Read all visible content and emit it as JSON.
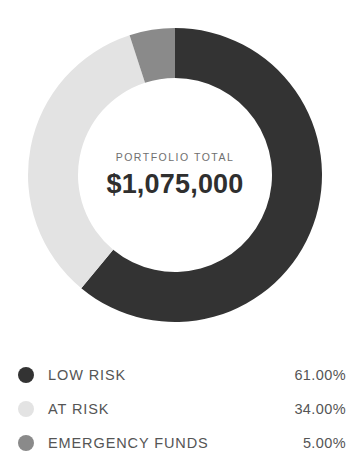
{
  "chart_data": {
    "type": "pie",
    "variant": "donut",
    "title": "",
    "center_caption": "PORTFOLIO TOTAL",
    "center_value": "$1,075,000",
    "total_value": 1075000,
    "currency": "$",
    "start_angle_deg": 0,
    "direction": "clockwise",
    "categories": [
      "LOW RISK",
      "AT RISK",
      "EMERGENCY FUNDS"
    ],
    "values": [
      61.0,
      34.0,
      5.0
    ],
    "value_labels": [
      "61.00%",
      "34.00%",
      "5.00%"
    ],
    "colors": [
      "#333333",
      "#e3e3e3",
      "#8a8a8a"
    ],
    "legend_position": "bottom",
    "grid": false,
    "slices": [
      {
        "label": "LOW RISK",
        "value": 61.0,
        "value_label": "61.00%",
        "color": "#333333",
        "start_deg": 0,
        "sweep_deg": 219.6
      },
      {
        "label": "AT RISK",
        "value": 34.0,
        "value_label": "34.00%",
        "color": "#e3e3e3",
        "start_deg": 219.6,
        "sweep_deg": 122.4
      },
      {
        "label": "EMERGENCY FUNDS",
        "value": 5.0,
        "value_label": "5.00%",
        "color": "#8a8a8a",
        "start_deg": 342.0,
        "sweep_deg": 18.0
      }
    ]
  },
  "legend": {
    "rows": [
      {
        "label": "LOW RISK",
        "value": "61.00%",
        "color": "#333333"
      },
      {
        "label": "AT RISK",
        "value": "34.00%",
        "color": "#e3e3e3"
      },
      {
        "label": "EMERGENCY FUNDS",
        "value": "5.00%",
        "color": "#8a8a8a"
      }
    ]
  },
  "theme": {
    "background": "#ffffff",
    "text": "#555555",
    "value_text": "#2f2f2f",
    "caption_text": "#6f6f6f"
  }
}
